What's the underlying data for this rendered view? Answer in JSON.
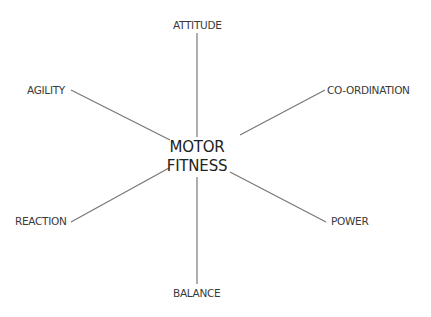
{
  "diagram": {
    "center": {
      "line1": "MOTOR",
      "line2": "FITNESS"
    },
    "nodes": {
      "attitude": "ATTITUDE",
      "agility": "AGILITY",
      "coordination": "CO-ORDINATION",
      "reaction": "REACTION",
      "power": "POWER",
      "balance": "BALANCE"
    },
    "line_color": "#777777"
  }
}
